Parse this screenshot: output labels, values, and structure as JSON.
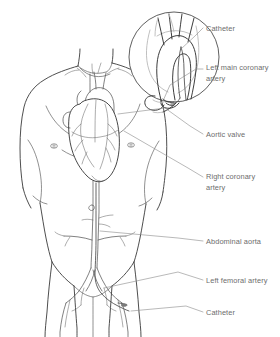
{
  "figure": {
    "background_color": "#ffffff",
    "width": 280,
    "height": 337,
    "line_color": "#3a3a3a",
    "label_color": "#6d6d6d",
    "leader_color": "#8a8a8a"
  },
  "labels": [
    {
      "id": "catheter-top",
      "text": "Catheter",
      "x": 206,
      "y": 24,
      "target": "catheter in aortic arch (inset)"
    },
    {
      "id": "left-main-coronary-artery",
      "text": "Left main coronary\nartery",
      "x": 206,
      "y": 63,
      "target": "left main coronary artery (inset)"
    },
    {
      "id": "aortic-valve",
      "text": "Aortic valve",
      "x": 206,
      "y": 130,
      "target": "aortic valve on heart"
    },
    {
      "id": "right-coronary-artery",
      "text": "Right coronary\nartery",
      "x": 206,
      "y": 172,
      "target": "right coronary artery on heart"
    },
    {
      "id": "abdominal-aorta",
      "text": "Abdominal aorta",
      "x": 206,
      "y": 237,
      "target": "abdominal aorta"
    },
    {
      "id": "left-femoral-artery",
      "text": "Left femoral artery",
      "x": 206,
      "y": 276,
      "target": "left femoral artery"
    },
    {
      "id": "catheter-bottom",
      "text": "Catheter",
      "x": 206,
      "y": 308,
      "target": "catheter entry at femoral artery"
    }
  ],
  "anatomy": {
    "torso": "male upper body, anterior view, shoulders to upper thighs",
    "inset": "magnified circular view of aortic arch with catheter tip",
    "structures": [
      "heart",
      "aortic arch",
      "thoracic aorta",
      "abdominal aorta",
      "renal arteries",
      "iliac arteries",
      "femoral arteries",
      "catheter"
    ]
  }
}
